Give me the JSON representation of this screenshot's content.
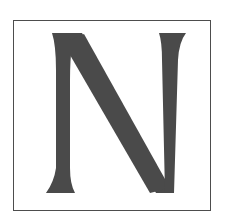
{
  "tile": {
    "letter": "N",
    "glyph_color": "#4a4a4a",
    "border_color": "#4d4d4d",
    "background_color": "#ffffff"
  }
}
